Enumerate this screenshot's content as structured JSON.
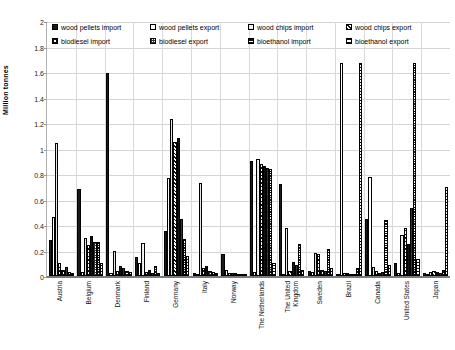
{
  "chart_data": {
    "type": "bar",
    "title": "",
    "xlabel": "",
    "ylabel": "Million tonnes",
    "ylim": [
      0,
      2
    ],
    "yticks": [
      "0",
      "0.2",
      "0.4",
      "0.6",
      "0.8",
      "1",
      "1.2",
      "1.4",
      "1.6",
      "1.8",
      "2"
    ],
    "grid": true,
    "legend_position": "top",
    "categories": [
      "Austria",
      "Belgium",
      "Denmark",
      "Finland",
      "Germany",
      "Italy",
      "Norway",
      "The Netherlands",
      "The United\nKingdom",
      "Sweden",
      "Brazil",
      "Canada",
      "United States",
      "Japan"
    ],
    "series": [
      {
        "name": "wood pellets  import",
        "pattern": "solid-black",
        "values": [
          0.28,
          0.68,
          1.59,
          0.15,
          0.35,
          0.02,
          0.17,
          0.9,
          0.72,
          0.04,
          0.01,
          0.45,
          0.1,
          0.02
        ]
      },
      {
        "name": "wood pellets  export",
        "pattern": "white",
        "values": [
          0.46,
          0.03,
          0.02,
          0.1,
          0.77,
          0.01,
          0.05,
          0.03,
          0.01,
          0.03,
          1.67,
          0.78,
          0.02,
          0.01
        ]
      },
      {
        "name": "wood chips import",
        "pattern": "dense-check",
        "values": [
          1.04,
          0.3,
          0.2,
          0.26,
          1.23,
          0.73,
          0.02,
          0.92,
          0.38,
          0.18,
          0.02,
          0.07,
          0.32,
          0.03
        ]
      },
      {
        "name": "wood chips export",
        "pattern": "diagonal-hatch",
        "values": [
          0.1,
          0.24,
          0.04,
          0.03,
          1.05,
          0.06,
          0.02,
          0.88,
          0.04,
          0.17,
          0.02,
          0.04,
          0.38,
          0.04
        ]
      },
      {
        "name": "biodiesel  import",
        "pattern": "coarse-check",
        "values": [
          0.05,
          0.31,
          0.08,
          0.05,
          1.08,
          0.08,
          0.02,
          0.86,
          0.11,
          0.05,
          0.01,
          0.02,
          0.25,
          0.03
        ]
      },
      {
        "name": "biodiesel  export",
        "pattern": "fine-check",
        "values": [
          0.07,
          0.27,
          0.06,
          0.02,
          0.45,
          0.04,
          0.01,
          0.85,
          0.09,
          0.04,
          0.01,
          0.03,
          0.53,
          0.02
        ]
      },
      {
        "name": "bioethanol  import",
        "pattern": "horizontal-lines-dense",
        "values": [
          0.03,
          0.27,
          0.04,
          0.08,
          0.29,
          0.03,
          0.01,
          0.84,
          0.25,
          0.21,
          0.06,
          0.44,
          1.67,
          0.05
        ]
      },
      {
        "name": "bioethanol  export",
        "pattern": "horizontal-lines-wide",
        "values": [
          0.02,
          0.1,
          0.03,
          0.02,
          0.16,
          0.02,
          0.01,
          0.1,
          0.05,
          0.06,
          1.67,
          0.09,
          0.13,
          0.7
        ]
      }
    ]
  },
  "legend": {
    "items": [
      {
        "label": "wood pellets  import",
        "swatch": "swatch-solid-black"
      },
      {
        "label": "wood pellets  export",
        "swatch": "swatch-white"
      },
      {
        "label": "wood chips import",
        "swatch": "swatch-dense-check"
      },
      {
        "label": "wood chips export",
        "swatch": "swatch-diagonal-hatch"
      },
      {
        "label": "biodiesel  import",
        "swatch": "swatch-coarse-check"
      },
      {
        "label": "biodiesel  export",
        "swatch": "swatch-fine-check"
      },
      {
        "label": "bioethanol  import",
        "swatch": "swatch-horizontal-dense"
      },
      {
        "label": "bioethanol  export",
        "swatch": "swatch-horizontal-wide"
      }
    ]
  },
  "axis": {
    "y_title": "Million tonnes"
  },
  "colors": {
    "bar_outline": "#111111",
    "grid": "#d4d4d4",
    "axis": "#7a7a7a",
    "background": "#ffffff",
    "text": "#111111"
  }
}
